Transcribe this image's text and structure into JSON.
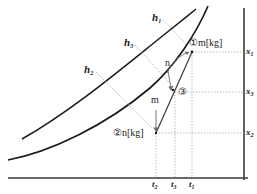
{
  "figure": {
    "type": "line-diagram",
    "axes": {
      "y_axis_position": "right",
      "x_axis_position": "bottom",
      "x_ticks": [
        {
          "label": "t",
          "sub": "2",
          "x": 156
        },
        {
          "label": "t",
          "sub": "3",
          "x": 175
        },
        {
          "label": "t",
          "sub": "1",
          "x": 193
        }
      ],
      "y_ticks": [
        {
          "label": "x",
          "sub": "1",
          "y": 52
        },
        {
          "label": "x",
          "sub": "3",
          "y": 92
        },
        {
          "label": "x",
          "sub": "2",
          "y": 133
        }
      ]
    },
    "curve_labels": [
      {
        "label": "h",
        "sub": "1",
        "x": 152,
        "y": 12
      },
      {
        "label": "h",
        "sub": "3",
        "x": 124,
        "y": 37
      },
      {
        "label": "h",
        "sub": "2",
        "x": 84,
        "y": 64
      }
    ],
    "annotations": [
      {
        "name": "point-1-label",
        "text": "①m[kg]",
        "x": 189,
        "y": 38
      },
      {
        "name": "point-2-label",
        "text": "②n[kg]",
        "x": 113,
        "y": 128
      },
      {
        "name": "point-3-label",
        "text": "③",
        "x": 178,
        "y": 87
      },
      {
        "name": "arrow-n-label",
        "text": "n",
        "x": 165,
        "y": 58
      },
      {
        "name": "arrow-m-label",
        "text": "m",
        "x": 153,
        "y": 95
      }
    ],
    "colors": {
      "curve": "#1a1a1a",
      "axis": "#3a3a3a",
      "guide": "#9a9a9a",
      "text": "#1a1a1a",
      "background": "#ffffff"
    }
  }
}
